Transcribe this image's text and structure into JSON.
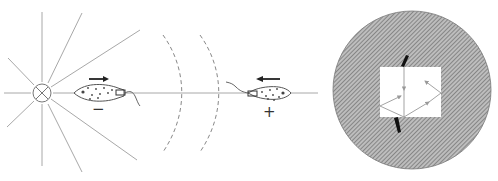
{
  "diagram": {
    "left_panel": {
      "description": "Radiating source with crossed-circle center, wavefront arcs, two cells moving in opposite directions",
      "source": {
        "icon": "crossed-circle-icon",
        "cx": 42,
        "cy": 93,
        "r": 9
      },
      "cell_left": {
        "direction": "right",
        "sign_label": "−"
      },
      "cell_right": {
        "direction": "left",
        "sign_label": "+"
      },
      "wavefronts": 2
    },
    "right_panel": {
      "description": "Hatched circular field with a white square window showing reflected ray paths",
      "circle": {
        "cx": 412,
        "cy": 90,
        "r": 79
      },
      "window": {
        "x": 380,
        "y": 67,
        "w": 61,
        "h": 50
      }
    },
    "colors": {
      "line": "#9a9a9a",
      "ink": "#222222",
      "hatch": "#8c8c8c",
      "background": "#ffffff"
    }
  }
}
